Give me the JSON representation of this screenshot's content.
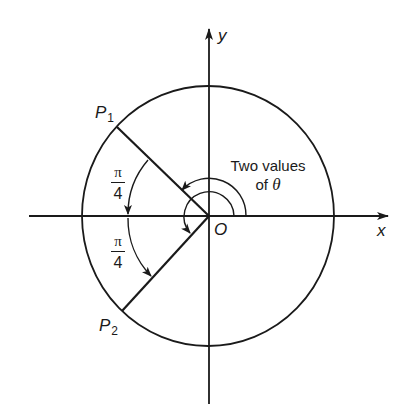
{
  "figure": {
    "type": "polar-angle-diagram",
    "colors": {
      "ink": "#1a1a1a",
      "background": "#ffffff"
    },
    "axes": {
      "x_label": "x",
      "y_label": "y",
      "origin_label": "O"
    },
    "points": [
      {
        "name": "P1",
        "base": "P",
        "subscript": "1",
        "angle_deg": 135
      },
      {
        "name": "P2",
        "base": "P",
        "subscript": "2",
        "angle_deg": 225
      }
    ],
    "angle_labels": [
      {
        "numerator": "π",
        "denominator": "4",
        "meaning": "from P1 to negative x-axis"
      },
      {
        "numerator": "π",
        "denominator": "4",
        "meaning": "from negative x-axis to P2"
      }
    ],
    "annotation": {
      "line1": "Two values",
      "line2_prefix": "of ",
      "line2_symbol": "θ"
    }
  }
}
